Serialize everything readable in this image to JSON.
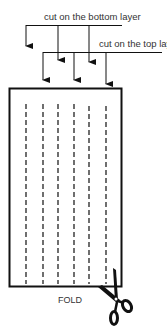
{
  "diagram": {
    "labels": {
      "bottom_layer": "cut on the bottom layer",
      "top_layer": "cut on the top layer",
      "fold": "FOLD"
    },
    "icons": {
      "scissors": "scissors-icon"
    },
    "colors": {
      "line": "#111111",
      "text": "#333333",
      "background": "#ffffff"
    },
    "cut_lines_count": 6
  }
}
